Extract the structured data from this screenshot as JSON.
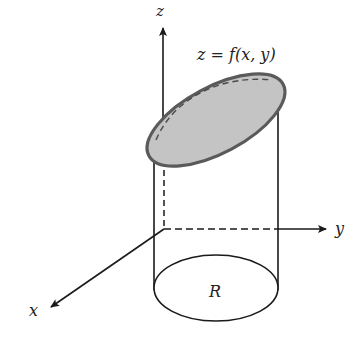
{
  "diagram": {
    "type": "3d-cylinder-under-surface",
    "labels": {
      "z_axis": "z",
      "y_axis": "y",
      "x_axis": "x",
      "surface": "z = f(x, y)",
      "region": "R"
    },
    "colors": {
      "surface_fill": "#c4c4c4",
      "surface_edge": "#5a5a5a",
      "lines": "#1a1a1a",
      "background": "#ffffff"
    }
  }
}
